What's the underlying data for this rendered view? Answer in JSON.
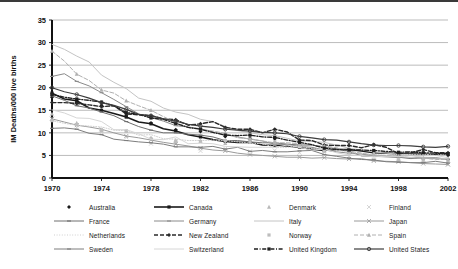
{
  "chart_data": {
    "type": "line",
    "title": "",
    "xlabel": "",
    "ylabel": "IM Deaths/000 live births",
    "xlim": [
      1970,
      2002
    ],
    "ylim": [
      0,
      35
    ],
    "ytick_step": 5,
    "xtick_step": 4,
    "grid": "horizontal",
    "legend_position": "bottom",
    "legend_columns": 4,
    "yticks": [
      "0",
      "5",
      "10",
      "15",
      "20",
      "25",
      "30",
      "35"
    ],
    "xticks": [
      "1970",
      "1974",
      "1978",
      "1982",
      "1986",
      "1990",
      "1994",
      "1998",
      "2002"
    ],
    "x": [
      1970,
      1971,
      1972,
      1973,
      1974,
      1975,
      1976,
      1977,
      1978,
      1979,
      1980,
      1981,
      1982,
      1983,
      1984,
      1985,
      1986,
      1987,
      1988,
      1989,
      1990,
      1991,
      1992,
      1993,
      1994,
      1995,
      1996,
      1997,
      1998,
      1999,
      2000,
      2001,
      2002
    ],
    "series": [
      {
        "name": "Australia",
        "color": "#1a1a1a",
        "style": "none",
        "width": 1,
        "marker": "diamond",
        "values": [
          17.9,
          17.3,
          16.7,
          16.5,
          16.1,
          14.3,
          13.8,
          12.5,
          12.2,
          11.4,
          10.7,
          10.0,
          10.3,
          9.6,
          9.2,
          9.9,
          8.8,
          8.7,
          8.7,
          8.0,
          8.2,
          7.1,
          7.0,
          6.1,
          5.9,
          5.7,
          5.8,
          5.3,
          5.0,
          5.7,
          5.2,
          5.3,
          5.0
        ]
      },
      {
        "name": "Canada",
        "color": "#1a1a1a",
        "style": "solid",
        "width": 1.6,
        "marker": "square",
        "values": [
          18.8,
          17.5,
          17.1,
          15.5,
          15.0,
          14.3,
          13.5,
          12.4,
          12.0,
          10.9,
          10.4,
          9.6,
          9.1,
          8.5,
          8.1,
          7.9,
          7.9,
          7.3,
          7.2,
          7.1,
          6.8,
          6.4,
          6.1,
          6.3,
          6.3,
          6.0,
          5.6,
          5.5,
          5.3,
          5.3,
          5.3,
          5.2,
          5.4
        ]
      },
      {
        "name": "Denmark",
        "color": "#b8b8b8",
        "style": "none",
        "width": 1,
        "marker": "triangle",
        "values": [
          14.2,
          13.5,
          12.2,
          11.5,
          10.5,
          10.4,
          10.4,
          9.1,
          8.9,
          8.7,
          8.4,
          7.9,
          8.2,
          7.7,
          7.7,
          7.9,
          8.3,
          8.3,
          7.5,
          7.9,
          7.5,
          7.3,
          6.6,
          5.4,
          5.5,
          5.1,
          5.6,
          5.3,
          4.7,
          4.2,
          5.3,
          4.9,
          4.4
        ]
      },
      {
        "name": "Finland",
        "color": "#cccccc",
        "style": "none",
        "width": 1,
        "marker": "cross",
        "values": [
          13.2,
          11.8,
          11.2,
          10.3,
          10.1,
          9.4,
          9.0,
          9.6,
          7.6,
          7.6,
          7.6,
          6.5,
          6.0,
          6.2,
          6.5,
          6.3,
          5.9,
          6.2,
          6.1,
          6.0,
          5.6,
          5.8,
          5.2,
          4.4,
          4.7,
          3.9,
          4.0,
          3.9,
          4.2,
          3.6,
          3.8,
          3.2,
          3.0
        ]
      },
      {
        "name": "France",
        "color": "#6e6e6e",
        "style": "solid",
        "width": 1,
        "marker": "dash",
        "values": [
          18.2,
          17.2,
          16.0,
          15.5,
          14.6,
          13.8,
          12.5,
          11.4,
          10.6,
          10.0,
          10.0,
          9.7,
          9.5,
          9.1,
          8.3,
          8.3,
          8.0,
          7.8,
          7.8,
          7.5,
          7.3,
          7.3,
          6.8,
          6.5,
          5.9,
          4.9,
          4.8,
          4.7,
          4.6,
          4.3,
          4.5,
          4.5,
          4.1
        ]
      },
      {
        "name": "Germany",
        "color": "#8a8a8a",
        "style": "solid",
        "width": 1,
        "marker": "dash",
        "values": [
          22.5,
          23.1,
          21.4,
          20.4,
          18.9,
          17.4,
          15.8,
          14.2,
          13.4,
          12.6,
          11.6,
          11.3,
          10.9,
          10.2,
          9.6,
          9.1,
          8.6,
          8.2,
          7.5,
          7.4,
          7.0,
          6.8,
          6.2,
          5.8,
          5.5,
          5.3,
          5.0,
          4.8,
          4.6,
          4.5,
          4.4,
          4.3,
          4.2
        ]
      },
      {
        "name": "Italy",
        "color": "#c4c4c4",
        "style": "solid",
        "width": 1,
        "marker": "none",
        "values": [
          29.6,
          28.5,
          27.0,
          25.7,
          22.8,
          21.2,
          19.8,
          17.7,
          17.0,
          15.5,
          14.6,
          14.1,
          13.0,
          12.5,
          11.4,
          10.5,
          10.0,
          9.6,
          9.4,
          8.8,
          8.2,
          8.1,
          7.9,
          7.3,
          6.6,
          6.2,
          5.8,
          5.5,
          5.3,
          5.1,
          4.5,
          4.4,
          4.3
        ]
      },
      {
        "name": "Japan",
        "color": "#9a9a9a",
        "style": "solid",
        "width": 1,
        "marker": "cross",
        "values": [
          13.1,
          12.4,
          11.7,
          11.3,
          10.8,
          10.0,
          9.3,
          8.9,
          8.4,
          7.9,
          7.5,
          7.1,
          6.6,
          6.2,
          6.0,
          5.5,
          5.2,
          5.0,
          4.8,
          4.6,
          4.6,
          4.4,
          4.5,
          4.3,
          4.2,
          4.3,
          3.8,
          3.7,
          3.6,
          3.4,
          3.2,
          3.1,
          3.0
        ]
      },
      {
        "name": "Netherlands",
        "color": "#cfcfcf",
        "style": "dotted",
        "width": 1,
        "marker": "none",
        "values": [
          12.7,
          12.1,
          11.7,
          11.5,
          11.3,
          10.6,
          10.5,
          9.5,
          9.6,
          8.7,
          8.6,
          8.3,
          8.3,
          8.4,
          8.3,
          8.0,
          7.7,
          7.6,
          6.8,
          6.8,
          7.1,
          6.5,
          6.3,
          6.3,
          5.6,
          5.5,
          5.2,
          5.0,
          5.2,
          5.2,
          5.1,
          5.4,
          5.0
        ]
      },
      {
        "name": "New Zealand",
        "color": "#2a2a2a",
        "style": "dashed",
        "width": 1.4,
        "marker": "diamond",
        "values": [
          16.7,
          16.7,
          16.5,
          16.2,
          15.8,
          16.0,
          14.2,
          14.0,
          13.8,
          13.1,
          12.9,
          11.7,
          12.0,
          12.5,
          11.2,
          10.8,
          10.8,
          10.0,
          10.8,
          10.2,
          8.4,
          8.3,
          7.3,
          7.2,
          7.2,
          6.7,
          7.4,
          6.8,
          5.4,
          5.6,
          6.3,
          5.6,
          5.6
        ]
      },
      {
        "name": "Norway",
        "color": "#bdbdbd",
        "style": "none",
        "width": 1,
        "marker": "square",
        "values": [
          12.7,
          12.8,
          11.8,
          11.9,
          10.5,
          11.1,
          10.5,
          9.7,
          8.7,
          8.8,
          8.1,
          7.5,
          8.1,
          7.9,
          8.3,
          8.5,
          7.9,
          8.4,
          8.0,
          7.7,
          6.9,
          6.4,
          5.9,
          5.0,
          5.2,
          4.0,
          4.0,
          4.1,
          4.0,
          3.9,
          3.8,
          3.9,
          3.5
        ]
      },
      {
        "name": "Spain",
        "color": "#b0b0b0",
        "style": "dashed",
        "width": 1,
        "marker": "triangle",
        "values": [
          28.1,
          25.9,
          23.0,
          21.6,
          19.5,
          18.8,
          17.1,
          16.0,
          15.0,
          13.6,
          12.3,
          11.2,
          10.8,
          10.4,
          9.9,
          8.9,
          8.7,
          8.2,
          7.8,
          7.8,
          7.6,
          7.2,
          7.1,
          6.7,
          6.0,
          5.5,
          5.0,
          5.0,
          4.9,
          4.5,
          4.4,
          4.1,
          4.1
        ]
      },
      {
        "name": "Sweden",
        "color": "#7d7d7d",
        "style": "solid",
        "width": 1,
        "marker": "dash",
        "values": [
          11.0,
          11.1,
          10.8,
          9.9,
          9.6,
          8.6,
          8.3,
          8.0,
          7.8,
          7.5,
          6.9,
          6.9,
          6.8,
          7.0,
          6.4,
          6.8,
          5.9,
          6.1,
          5.8,
          5.8,
          6.0,
          6.1,
          5.2,
          4.8,
          4.4,
          4.1,
          4.0,
          3.6,
          3.5,
          3.4,
          3.4,
          3.7,
          3.3
        ]
      },
      {
        "name": "Switzerland",
        "color": "#d6d6d6",
        "style": "solid",
        "width": 1,
        "marker": "none",
        "values": [
          15.1,
          14.4,
          13.3,
          13.2,
          12.5,
          10.7,
          10.7,
          9.8,
          8.6,
          8.5,
          9.1,
          7.6,
          7.7,
          7.6,
          7.0,
          6.9,
          6.8,
          6.8,
          6.8,
          7.3,
          6.8,
          6.2,
          6.4,
          5.6,
          5.1,
          5.0,
          4.7,
          4.8,
          4.8,
          4.6,
          4.9,
          5.0,
          4.5
        ]
      },
      {
        "name": "United Kingdom",
        "color": "#1f1f1f",
        "style": "dashdot",
        "width": 1.3,
        "marker": "square",
        "values": [
          18.5,
          17.9,
          17.5,
          17.2,
          16.8,
          16.0,
          14.5,
          14.1,
          13.3,
          13.0,
          12.1,
          11.2,
          10.8,
          10.1,
          9.5,
          9.4,
          9.5,
          9.1,
          9.0,
          8.4,
          7.9,
          7.4,
          6.6,
          6.3,
          6.2,
          6.2,
          6.1,
          5.9,
          5.7,
          5.8,
          5.6,
          5.5,
          5.3
        ]
      },
      {
        "name": "United States",
        "color": "#3d3d3d",
        "style": "solid",
        "width": 1.2,
        "marker": "circle",
        "values": [
          20.0,
          19.1,
          18.5,
          17.7,
          16.7,
          16.1,
          15.2,
          14.1,
          13.8,
          13.1,
          12.6,
          11.9,
          11.5,
          11.2,
          10.8,
          10.6,
          10.4,
          10.1,
          10.0,
          9.8,
          9.2,
          8.9,
          8.5,
          8.4,
          8.0,
          7.6,
          7.3,
          7.2,
          7.2,
          7.1,
          6.9,
          6.8,
          7.0
        ]
      }
    ]
  },
  "legend": {
    "rows": [
      [
        {
          "label": "Australia",
          "key": "marker-only-diamond-dark"
        },
        {
          "label": "Canada",
          "key": "solid-dark-square"
        },
        {
          "label": "Denmark",
          "key": "marker-only-triangle-light"
        },
        {
          "label": "Finland",
          "key": "marker-only-cross-light"
        }
      ],
      [
        {
          "label": "France",
          "key": "solid-gray-dash"
        },
        {
          "label": "Germany",
          "key": "solid-gray-dash"
        },
        {
          "label": "Italy",
          "key": "solid-light"
        },
        {
          "label": "Japan",
          "key": "solid-gray-cross"
        }
      ],
      [
        {
          "label": "Netherlands",
          "key": "dotted-light"
        },
        {
          "label": "New Zealand",
          "key": "dashed-dark-diamond"
        },
        {
          "label": "Norway",
          "key": "marker-only-square-light"
        },
        {
          "label": "Spain",
          "key": "dashed-light-triangle"
        }
      ],
      [
        {
          "label": "Sweden",
          "key": "solid-gray-dash"
        },
        {
          "label": "Switzerland",
          "key": "solid-light"
        },
        {
          "label": "United Kingdom",
          "key": "dashdot-dark-square"
        },
        {
          "label": "United States",
          "key": "solid-dark-circle"
        }
      ]
    ]
  }
}
